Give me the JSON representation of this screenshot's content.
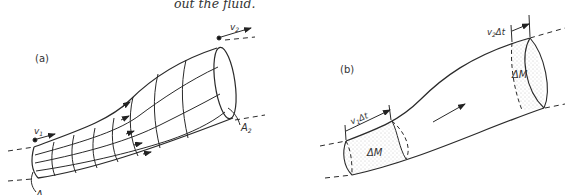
{
  "caption": "out the fluid.",
  "panel_a": {
    "label": "(a)",
    "v1": "v",
    "v1_sub": "1",
    "v2": "v",
    "v2_sub": "2",
    "A1": "A",
    "A1_sub": "1",
    "A2": "A",
    "A2_sub": "2"
  },
  "panel_b": {
    "label": "(b)",
    "v1dt": "v",
    "v1dt_sub": "1",
    "v1dt_rest": "Δt",
    "v2dt": "v",
    "v2dt_sub": "2",
    "v2dt_rest": "Δt",
    "dM_left": "ΔM",
    "dM_right": "ΔM"
  },
  "colors": {
    "stroke": "#2a2a2a",
    "stipple": "#9a9a9a",
    "text": "#333333"
  }
}
